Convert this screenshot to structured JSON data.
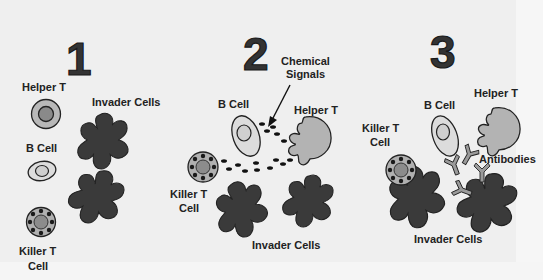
{
  "panels": [
    {
      "number": "1",
      "labels": {
        "helper_t": "Helper T",
        "b_cell": "B Cell",
        "killer_t_line1": "Killer T",
        "killer_t_line2": "Cell",
        "invader_cells": "Invader Cells"
      }
    },
    {
      "number": "2",
      "labels": {
        "chemical_signals_line1": "Chemical",
        "chemical_signals_line2": "Signals",
        "b_cell": "B Cell",
        "helper_t": "Helper T",
        "killer_t_line1": "Killer T",
        "killer_t_line2": "Cell",
        "invader_cells": "Invader Cells"
      }
    },
    {
      "number": "3",
      "labels": {
        "b_cell": "B Cell",
        "helper_t": "Helper T",
        "killer_t_line1": "Killer T",
        "killer_t_line2": "Cell",
        "antibodies": "Antibodies",
        "invader_cells": "Invader Cells"
      }
    }
  ],
  "colors": {
    "background": "#efefef",
    "invader": "#3a3a3a",
    "helper_t_outer": "#b8b8b8",
    "helper_t_inner": "#8a8a8a",
    "b_cell_fill": "#dcdcdc",
    "killer_t_outer": "#b0b0b0",
    "killer_t_inner": "#8c8c8c",
    "granule": "#1a1a1a",
    "antibody": "#9a9a9a"
  }
}
